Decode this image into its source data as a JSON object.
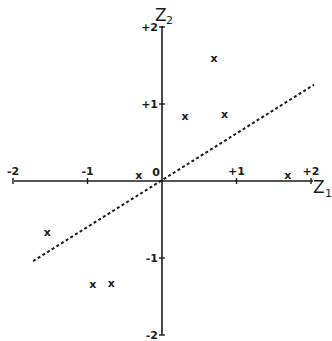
{
  "chart_data": {
    "type": "scatter",
    "title": "",
    "xlabel": "Z1",
    "ylabel": "Z2",
    "xlim": [
      -2,
      2
    ],
    "ylim": [
      -2,
      2
    ],
    "grid": false,
    "legend": null,
    "x_ticks": [
      "-2",
      "-1",
      "0",
      "+1",
      "+2"
    ],
    "y_ticks": [
      "+2",
      "+1",
      "-1",
      "-2"
    ],
    "origin_label": "0",
    "marker": "x",
    "series": [
      {
        "name": "observations",
        "points": [
          {
            "x": 0.7,
            "y": 1.6
          },
          {
            "x": 0.31,
            "y": 0.84
          },
          {
            "x": 0.84,
            "y": 0.87
          },
          {
            "x": -0.31,
            "y": 0.08
          },
          {
            "x": 1.69,
            "y": 0.08
          },
          {
            "x": -1.54,
            "y": -0.66
          },
          {
            "x": -0.93,
            "y": -1.34
          },
          {
            "x": -0.68,
            "y": -1.32
          }
        ]
      }
    ],
    "reference_line": {
      "style": "dashed",
      "from": {
        "x": -1.73,
        "y": -1.04
      },
      "to": {
        "x": 2.04,
        "y": 1.25
      }
    }
  },
  "axes": {
    "x_title_main": "Z",
    "x_title_sub": "1",
    "y_title_main": "Z",
    "y_title_sub": "2"
  },
  "colors": {
    "ink": "#1a1a1a",
    "background": "#ffffff"
  }
}
